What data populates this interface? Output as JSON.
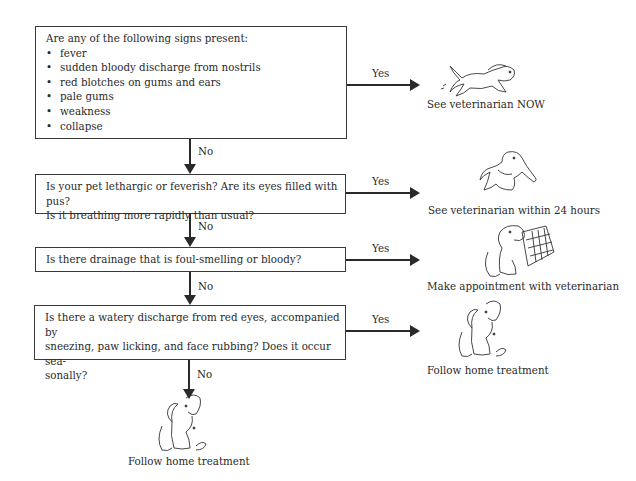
{
  "flowchart": {
    "q1": {
      "intro": "Are any of the following signs present:",
      "signs": [
        "fever",
        "sudden bloody discharge from nostrils",
        "red blotches on gums and ears",
        "pale gums",
        "weakness",
        "collapse"
      ],
      "yes_label": "Yes",
      "no_label": "No",
      "outcome": "See veterinarian NOW",
      "illustration": "running-dog-icon"
    },
    "q2": {
      "line1": "Is your pet lethargic or feverish? Are its eyes filled with pus?",
      "line2": "Is it breathing more rapidly than usual?",
      "yes_label": "Yes",
      "no_label": "No",
      "outcome": "See veterinarian within 24 hours",
      "illustration": "sick-dog-icon"
    },
    "q3": {
      "line1": "Is there drainage that is foul-smelling or bloody?",
      "yes_label": "Yes",
      "no_label": "No",
      "outcome": "Make appointment with veterinarian",
      "illustration": "dog-calendar-icon"
    },
    "q4": {
      "line1": "Is there a watery discharge from red eyes, accompanied by",
      "line2": "sneezing, paw licking, and face rubbing? Does it occur sea-",
      "line3": "sonally?",
      "yes_label": "Yes",
      "no_label": "No",
      "outcome_yes": "Follow home treatment",
      "outcome_no": "Follow home treatment",
      "illustration": "sitting-dog-icon"
    }
  }
}
